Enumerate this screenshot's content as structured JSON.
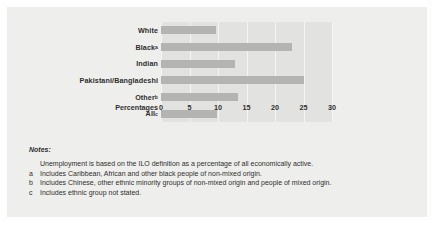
{
  "chart_data": {
    "type": "bar",
    "orientation": "horizontal",
    "title": "",
    "xlabel": "Percentages",
    "ylabel": "",
    "xlim": [
      0,
      30
    ],
    "xticks": [
      "0",
      "5",
      "10",
      "15",
      "20",
      "25",
      "30"
    ],
    "grid": true,
    "legend": "none",
    "bar_color": "#b4b4b2",
    "plot_bg": "#e2e2e0",
    "categories": [
      "White",
      "Black",
      "Indian",
      "Pakistani/Bangladeshi",
      "Other",
      "All"
    ],
    "category_footnotes": [
      "",
      "a",
      "",
      "",
      "b",
      "c"
    ],
    "values": [
      9.6,
      22.9,
      13.0,
      25.0,
      13.5,
      9.8
    ]
  },
  "axis": {
    "title": "Percentages",
    "ticks": [
      {
        "label": "0",
        "value": 0
      },
      {
        "label": "5",
        "value": 5
      },
      {
        "label": "10",
        "value": 10
      },
      {
        "label": "15",
        "value": 15
      },
      {
        "label": "20",
        "value": 20
      },
      {
        "label": "25",
        "value": 25
      },
      {
        "label": "30",
        "value": 30
      }
    ]
  },
  "notes": {
    "heading": "Notes:",
    "lines": [
      {
        "marker": "",
        "text": "Unemployment is based on the ILO definition as a percentage of all economically active."
      },
      {
        "marker": "a",
        "text": "Includes Caribbean, African and other black people of non-mixed origin."
      },
      {
        "marker": "b",
        "text": "Includes Chinese, other ethnic minority groups of non-mixed origin and people of mixed origin."
      },
      {
        "marker": "c",
        "text": "Includes ethnic group not stated."
      }
    ]
  }
}
